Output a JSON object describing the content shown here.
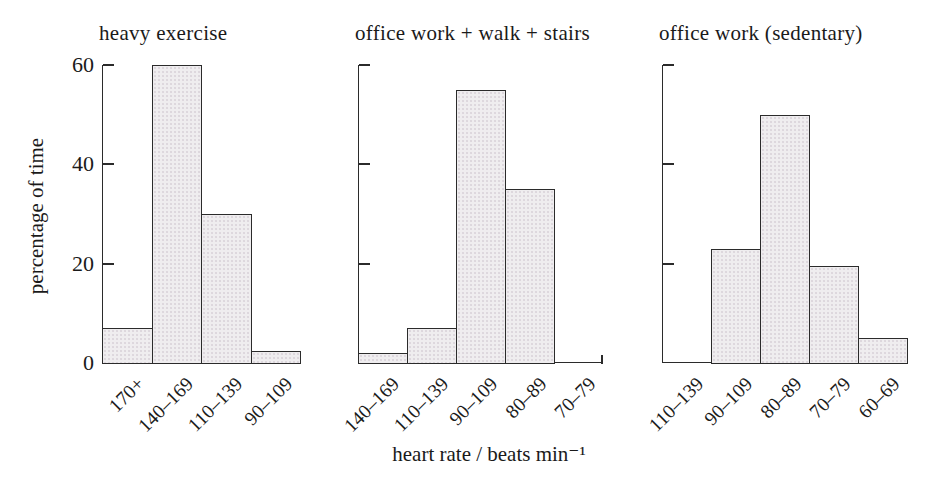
{
  "chart_data": {
    "type": "bar",
    "xlabel": "heart rate / beats min⁻¹",
    "ylabel": "percentage of time",
    "ylim": [
      0,
      60
    ],
    "yticks": [
      0,
      20,
      40,
      60
    ],
    "grid": false,
    "legend": "none",
    "bar_fill": "#efedef",
    "bar_edge": "#2b2b2b",
    "text_color": "#1a1a1a",
    "background": "#ffffff",
    "panels": [
      {
        "title": "heavy exercise",
        "categories": [
          "170+",
          "140–169",
          "110–139",
          "90–109"
        ],
        "values": [
          7,
          60,
          30,
          2.5
        ],
        "ytick_labels_visible": true
      },
      {
        "title": "office work + walk + stairs",
        "categories": [
          "140–169",
          "110–139",
          "90–109",
          "80–89",
          "70–79"
        ],
        "values": [
          2,
          7,
          55,
          35,
          0
        ],
        "ytick_labels_visible": false
      },
      {
        "title": "office work (sedentary)",
        "categories": [
          "110–139",
          "90–109",
          "80–89",
          "70–79",
          "60–69"
        ],
        "values": [
          0,
          23,
          50,
          19.5,
          5
        ],
        "ytick_labels_visible": false
      }
    ]
  }
}
